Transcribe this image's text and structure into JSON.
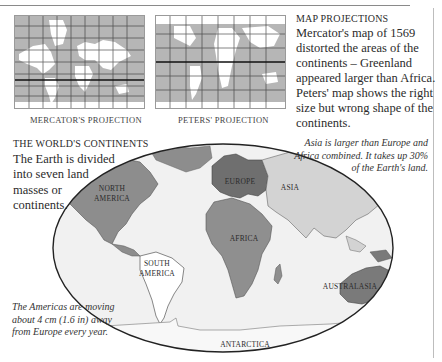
{
  "page": {
    "background": "#ffffff"
  },
  "mini_maps": [
    {
      "id": "mercator",
      "caption": "Mercator's projection"
    },
    {
      "id": "peters",
      "caption": "Peters' projection"
    }
  ],
  "map_projections": {
    "heading": "Map projections",
    "body": "Mercator's map of 1569 distorted the areas of the continents – Greenland appeared larger than Africa. Peters' map shows the right size but wrong shape of the continents."
  },
  "worlds_continents": {
    "heading": "The world's continents",
    "body": "The Earth is divided into seven land masses or continents."
  },
  "notes": {
    "asia": "Asia is larger than Europe and Africa combined. It takes up 30% of the Earth's land.",
    "americas": "The Americas are moving about 4 cm (1.6 in) away from Europe every year."
  },
  "world_map": {
    "labels": {
      "north_america_1": "North",
      "north_america_2": "America",
      "europe": "Europe",
      "asia": "Asia",
      "africa": "Africa",
      "south_america_1": "South",
      "south_america_2": "America",
      "australasia": "Australasia",
      "antarctica": "Antarctica"
    },
    "colors": {
      "ocean": "#f1f1f1",
      "north_america": "#8d8d8d",
      "europe": "#6f6f6f",
      "asia": "#d3d3d3",
      "africa": "#8f8f8f",
      "south_america": "#ffffff",
      "australasia": "#7a7a7a",
      "antarctica": "#f7f7f7",
      "outline": "#222222"
    }
  }
}
